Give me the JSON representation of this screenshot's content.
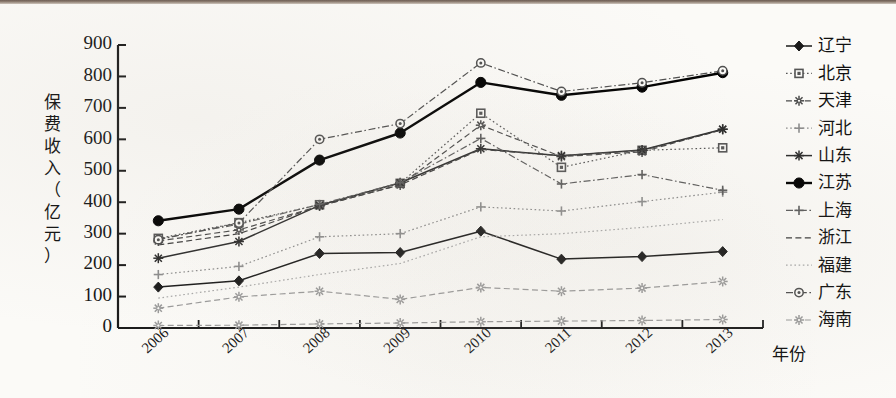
{
  "figure": {
    "y_axis_label": "保费收入（亿元）",
    "y_axis_label_chars": [
      "保",
      "费",
      "收",
      "入",
      "（",
      "亿",
      "元",
      "）"
    ],
    "x_axis_label": "年份",
    "y_ticks": [
      "0",
      "100",
      "200",
      "300",
      "400",
      "500",
      "600",
      "700",
      "800",
      "900"
    ],
    "x_ticks": [
      "2006",
      "2007",
      "2008",
      "2009",
      "2010",
      "2011",
      "2012",
      "2013"
    ]
  },
  "legend": {
    "items": [
      {
        "label": "辽宁",
        "marker": "diamond-marker",
        "style": "solid",
        "color": "#1a1a1a"
      },
      {
        "label": "北京",
        "marker": "square-marker",
        "style": "dotted",
        "color": "#555555"
      },
      {
        "label": "天津",
        "marker": "star-marker",
        "style": "dashed",
        "color": "#4a4a4a"
      },
      {
        "label": "河北",
        "marker": "plus-marker",
        "style": "dotted",
        "color": "#8c8c8c"
      },
      {
        "label": "山东",
        "marker": "asterisk-marker",
        "style": "solid",
        "color": "#2b2b2b"
      },
      {
        "label": "江苏",
        "marker": "circle-marker",
        "style": "solid-bold",
        "color": "#000000"
      },
      {
        "label": "上海",
        "marker": "plus-marker",
        "style": "dashdot",
        "color": "#5c5c5c"
      },
      {
        "label": "浙江",
        "marker": "none-marker",
        "style": "dashed",
        "color": "#3d3d3d"
      },
      {
        "label": "福建",
        "marker": "none-marker",
        "style": "dotted",
        "color": "#a8a8a8"
      },
      {
        "label": "广东",
        "marker": "circledot-marker",
        "style": "dashdot",
        "color": "#4f4f4f"
      },
      {
        "label": "海南",
        "marker": "star-marker",
        "style": "dashed",
        "color": "#9a9a9a"
      }
    ]
  },
  "chart_data": {
    "type": "line",
    "title": "",
    "xlabel": "年份",
    "ylabel": "保费收入（亿元）",
    "categories": [
      "2006",
      "2007",
      "2008",
      "2009",
      "2010",
      "2011",
      "2012",
      "2013"
    ],
    "ylim": [
      0,
      900
    ],
    "ytick_step": 100,
    "grid": false,
    "legend_position": "right",
    "series": [
      {
        "name": "辽宁",
        "values": [
          130,
          150,
          237,
          240,
          308,
          219,
          227,
          243
        ]
      },
      {
        "name": "北京",
        "values": [
          285,
          335,
          392,
          460,
          683,
          511,
          565,
          573
        ]
      },
      {
        "name": "天津",
        "values": [
          277,
          312,
          388,
          455,
          645,
          545,
          560,
          632
        ]
      },
      {
        "name": "河北",
        "values": [
          170,
          196,
          290,
          300,
          385,
          372,
          402,
          432
        ]
      },
      {
        "name": "山东",
        "values": [
          222,
          275,
          390,
          462,
          570,
          548,
          566,
          632
        ]
      },
      {
        "name": "江苏",
        "values": [
          341,
          378,
          534,
          620,
          781,
          740,
          766,
          812
        ]
      },
      {
        "name": "上海",
        "values": [
          283,
          330,
          393,
          462,
          603,
          458,
          488,
          438
        ]
      },
      {
        "name": "浙江",
        "values": [
          264,
          300,
          388,
          455,
          568,
          548,
          565,
          630
        ]
      },
      {
        "name": "福建",
        "values": [
          95,
          130,
          170,
          205,
          290,
          300,
          320,
          345
        ]
      },
      {
        "name": "广东",
        "values": [
          281,
          334,
          600,
          650,
          843,
          752,
          780,
          818
        ]
      },
      {
        "name": "海南",
        "values": [
          8,
          9,
          13,
          16,
          20,
          22,
          24,
          27
        ]
      },
      {
        "name": "辽宁2",
        "values": [
          63,
          99,
          117,
          91,
          129,
          117,
          127,
          148
        ]
      }
    ]
  }
}
